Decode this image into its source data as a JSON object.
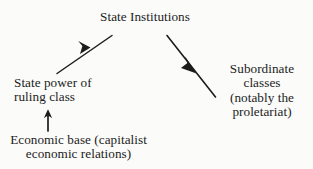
{
  "diagram": {
    "type": "flow-diagram",
    "title": "State Institutions",
    "background_color": "#fbfbf9",
    "ink_color": "#1c1c1c",
    "nodes": [
      {
        "id": "state-institutions",
        "label": "State Institutions",
        "lines": [
          "State Institutions"
        ],
        "align": "center"
      },
      {
        "id": "state-power",
        "label": "State power of ruling class",
        "lines": [
          "State power of",
          "ruling class"
        ],
        "align": "left"
      },
      {
        "id": "economic-base",
        "label": "Economic base (capitalist economic relations)",
        "lines": [
          "Economic base (capitalist",
          "economic relations)"
        ],
        "align": "center"
      },
      {
        "id": "subordinate-classes",
        "label": "Subordinate classes (notably the proletariat)",
        "lines": [
          "Subordinate",
          "classes",
          "(notably the",
          "proletariat)"
        ],
        "align": "center"
      }
    ],
    "arrows": [
      {
        "id": "arrow-power-to-institutions",
        "from": "state-power",
        "to": "state-institutions",
        "direction": "up-right",
        "head_position": "midpoint"
      },
      {
        "id": "arrow-institutions-to-subordinate",
        "from": "state-institutions",
        "to": "subordinate-classes",
        "direction": "down-right",
        "head_position": "midpoint"
      },
      {
        "id": "arrow-base-to-power",
        "from": "economic-base",
        "to": "state-power",
        "direction": "up",
        "head_position": "end"
      }
    ]
  }
}
